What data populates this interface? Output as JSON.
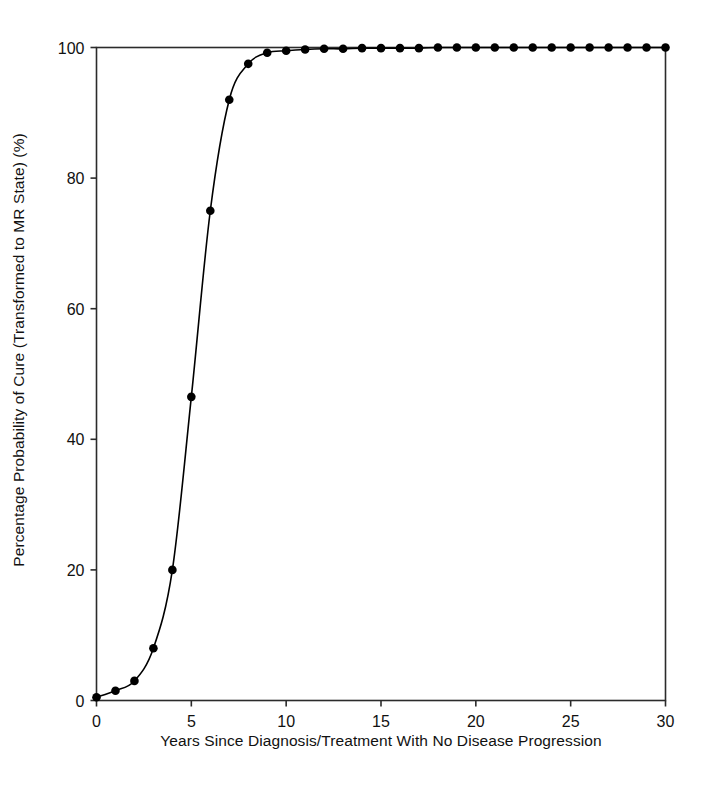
{
  "chart": {
    "xlabel": "Years Since Diagnosis/Treatment With No Disease Progression",
    "ylabel": "Percentage Probability of Cure (Transformed to MR State) (%)"
  },
  "chart_data": {
    "type": "line",
    "title": "",
    "subtitle": "",
    "xlabel": "Years Since Diagnosis/Treatment With No Disease Progression",
    "ylabel": "Percentage Probability of Cure (Transformed to MR State) (%)",
    "xlim": [
      0,
      30
    ],
    "ylim": [
      0,
      100
    ],
    "xticks": [
      0,
      5,
      10,
      15,
      20,
      25,
      30
    ],
    "xtick_labels": [
      "0",
      "5",
      "10",
      "15",
      "20",
      "25",
      "30"
    ],
    "yticks": [
      0,
      20,
      40,
      60,
      80,
      100
    ],
    "ytick_labels": [
      "0",
      "20",
      "40",
      "60",
      "80",
      "100"
    ],
    "grid": false,
    "legend": "none",
    "marker": "filled-circle",
    "line_color": "#000000",
    "marker_color": "#000000",
    "background_color": "#ffffff",
    "series": [
      {
        "name": "Probability of cure",
        "x": [
          0,
          1,
          2,
          3,
          4,
          5,
          6,
          7,
          8,
          9,
          10,
          11,
          12,
          13,
          14,
          15,
          16,
          17,
          18,
          19,
          20,
          21,
          22,
          23,
          24,
          25,
          26,
          27,
          28,
          29,
          30
        ],
        "values": [
          0.5,
          1.5,
          3.0,
          8.0,
          20.0,
          46.5,
          75.0,
          92.0,
          97.5,
          99.2,
          99.5,
          99.7,
          99.8,
          99.8,
          99.9,
          99.9,
          99.9,
          99.9,
          100.0,
          100.0,
          100.0,
          100.0,
          100.0,
          100.0,
          100.0,
          100.0,
          100.0,
          100.0,
          100.0,
          100.0,
          100.0
        ]
      }
    ]
  }
}
